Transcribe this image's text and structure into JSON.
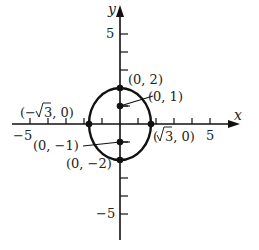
{
  "diagram": {
    "type": "ellipse-graph",
    "equation_implied": "x^2/3 + y^2/4 = 1",
    "axes": {
      "x_label": "x",
      "y_label": "y",
      "x_tick_label_neg": "−5",
      "x_tick_label_pos": "5",
      "y_tick_label_pos": "5",
      "y_tick_label_neg": "−5",
      "range": [
        -5,
        5
      ]
    },
    "vertices": [
      {
        "label": "(0, 2)",
        "x": 0,
        "y": 2
      },
      {
        "label": "(0, −2)",
        "x": 0,
        "y": -2
      }
    ],
    "co_vertices": [
      {
        "label": "(−√3, 0)",
        "x": -1.732,
        "y": 0
      },
      {
        "label": "(√3, 0)",
        "x": 1.732,
        "y": 0
      }
    ],
    "foci": [
      {
        "label": "(0, 1)",
        "x": 0,
        "y": 1
      },
      {
        "label": "(0, −1)",
        "x": 0,
        "y": -1
      }
    ],
    "colors": {
      "stroke": "#111111",
      "text": "#222222",
      "background": "#ffffff"
    }
  },
  "labels": {
    "v_top": "(0, 2)",
    "v_bottom": "(0, −2)",
    "c_left_pre": "(−",
    "c_left_post": "3, 0)",
    "c_right_pre": "(",
    "c_right_post": "3, 0)",
    "f_top": "(0, 1)",
    "f_bottom": "(0, −1)",
    "x_axis": "x",
    "y_axis": "y",
    "tick_x_neg5": "−5",
    "tick_x_pos5": "5",
    "tick_y_pos5": "5",
    "tick_y_neg5": "−5"
  }
}
